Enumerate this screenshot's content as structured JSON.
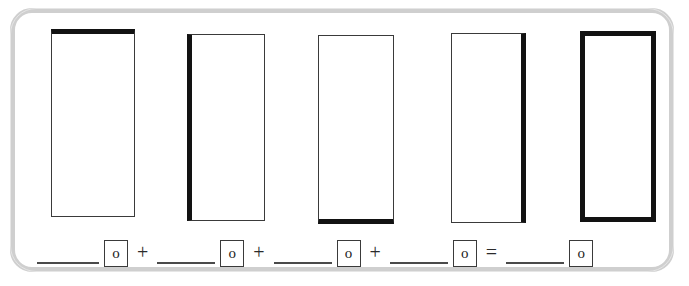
{
  "worksheet": {
    "frame_color": "#cfcfcf",
    "stroke_color": "#121212",
    "thin_stroke_color": "#3a3a3a",
    "background": "#ffffff",
    "shapes": [
      {
        "id": "rectangle-1",
        "label": "",
        "emphasized_side": "top",
        "side_class": "thick-top"
      },
      {
        "id": "rectangle-2",
        "label": "",
        "emphasized_side": "left",
        "side_class": "thick-left"
      },
      {
        "id": "rectangle-3",
        "label": "",
        "emphasized_side": "bottom",
        "side_class": "thick-bottom"
      },
      {
        "id": "rectangle-4",
        "label": "",
        "emphasized_side": "right",
        "side_class": "thick-right"
      },
      {
        "id": "rectangle-5",
        "label": "",
        "emphasized_side": "all",
        "side_class": "thick-all"
      }
    ],
    "equation": {
      "terms": [
        {
          "blank_value": "",
          "unit": "o"
        },
        {
          "blank_value": "",
          "unit": "o"
        },
        {
          "blank_value": "",
          "unit": "o"
        },
        {
          "blank_value": "",
          "unit": "o"
        },
        {
          "blank_value": "",
          "unit": "o"
        }
      ],
      "operators": {
        "plus": "+",
        "equals": "="
      }
    }
  }
}
